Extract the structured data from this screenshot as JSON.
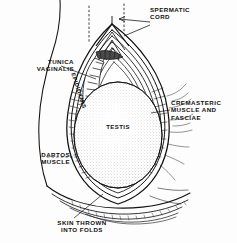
{
  "figure": {
    "type": "anatomical-illustration",
    "style": "black-and-white line drawing with stipple and hatching",
    "background_color": "#fdfdfd",
    "ink_color": "#111111"
  },
  "labels": {
    "spermatic_cord": "SPERMATIC\nCORD",
    "tunica_vaginalis": "TUNICA\nVAGINALIS",
    "cremasteric": "CREMASTERIC\nMUSCLE AND\nFASCIAE",
    "dartos": "DARTOS\nMUSCLE",
    "skin": "SKIN THROWN\nINTO FOLDS",
    "testis": "TESTIS",
    "epididymis": "EPIDIDYMIS"
  },
  "leaders": {
    "spermatic_cord": "arrow pointing left into the apex of the spermatic cord",
    "tunica_vaginalis": "straight line to inner serous layer at upper left",
    "cremasteric": "straight line to layered bands at right margin",
    "dartos": "dashed line to outer muscular layer at left",
    "skin": "line to the folded scrotal skin at bottom"
  },
  "guides": {
    "dotted_vertical_left": "dotted vertical guide line at top left of cord",
    "dotted_vertical_right": "dotted vertical guide line at top right of cord"
  }
}
